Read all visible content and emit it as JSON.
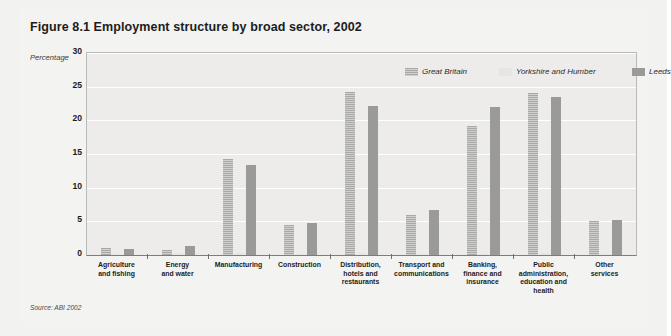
{
  "figure": {
    "title": "Figure 8.1  Employment structure by broad sector, 2002",
    "source": "Source: ABI 2002",
    "y_axis_label": "Percentage"
  },
  "chart_data": {
    "type": "bar",
    "title": "Figure 8.1  Employment structure by broad sector, 2002",
    "xlabel": "",
    "ylabel": "Percentage",
    "ylim": [
      0,
      30
    ],
    "yticks": [
      0,
      5,
      10,
      15,
      20,
      25,
      30
    ],
    "grid": true,
    "legend_position": "top-right",
    "categories": [
      "Agriculture and fishing",
      "Energy and water",
      "Manufacturing",
      "Construction",
      "Distribution, hotels and restaurants",
      "Transport and communications",
      "Banking, finance and insurance",
      "Public administration, education and health",
      "Other services"
    ],
    "category_lines": [
      [
        "Agriculture",
        "and fishing"
      ],
      [
        "Energy",
        "and water"
      ],
      [
        "Manufacturing"
      ],
      [
        "Construction"
      ],
      [
        "Distribution,",
        "hotels and",
        "restaurants"
      ],
      [
        "Transport and",
        "communications"
      ],
      [
        "Banking,",
        "finance and",
        "insurance"
      ],
      [
        "Public",
        "administration,",
        "education and",
        "health"
      ],
      [
        "Other",
        "services"
      ]
    ],
    "series": [
      {
        "name": "Great Britain",
        "color": "#b4b4b1",
        "style": "hatched",
        "values": [
          1.0,
          0.8,
          14.3,
          4.5,
          24.2,
          5.9,
          19.2,
          24.0,
          5.1
        ]
      },
      {
        "name": "Yorkshire and Humber",
        "color": "#e6e5e2",
        "style": "plain-light",
        "values": [
          0.2,
          0.3,
          0.3,
          0.2,
          0.3,
          0.2,
          0.2,
          0.3,
          0.2
        ]
      },
      {
        "name": "Leeds",
        "color": "#9a9a97",
        "style": "solid",
        "values": [
          0.9,
          1.3,
          13.4,
          4.8,
          22.1,
          6.7,
          22.0,
          23.5,
          5.2
        ]
      }
    ]
  }
}
